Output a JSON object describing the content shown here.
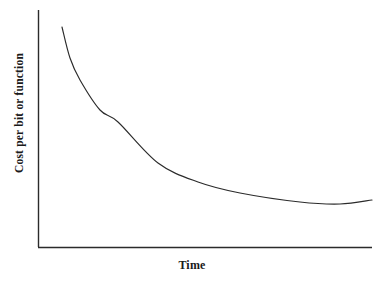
{
  "figure": {
    "background_color": "#ffffff",
    "line_color": "#2b2b2b",
    "axis_color": "#2b2b2b",
    "ylabel": "Cost per bit or function",
    "xlabel": "Time"
  },
  "chart_data": {
    "type": "line",
    "title": "",
    "subtitle": "",
    "xlabel": "Time",
    "ylabel": "Cost per bit or function",
    "grid": false,
    "legend": null,
    "annotations": [],
    "axis_ticks": {
      "x": [],
      "y": []
    },
    "xlim": [
      0,
      1
    ],
    "ylim": [
      0,
      1
    ],
    "series": [
      {
        "name": "Cost per bit or function",
        "x": [
          0.072,
          0.096,
          0.126,
          0.186,
          0.24,
          0.359,
          0.479,
          0.605,
          0.784,
          0.904,
          1.0
        ],
        "y": [
          0.929,
          0.798,
          0.705,
          0.578,
          0.527,
          0.354,
          0.273,
          0.227,
          0.19,
          0.18,
          0.175
        ],
        "pixel_points": [
          [
            62,
            27
          ],
          [
            70,
            58
          ],
          [
            80,
            80
          ],
          [
            100,
            110
          ],
          [
            118,
            122
          ],
          [
            158,
            163
          ],
          [
            198,
            182
          ],
          [
            240,
            193
          ],
          [
            300,
            202
          ],
          [
            340,
            204
          ],
          [
            372,
            200
          ]
        ]
      }
    ]
  },
  "axes_geometry": {
    "y_axis": {
      "x": 38,
      "y_top": 10,
      "y_bottom": 247
    },
    "x_axis": {
      "y": 247,
      "x_left": 38,
      "x_right": 372
    }
  }
}
